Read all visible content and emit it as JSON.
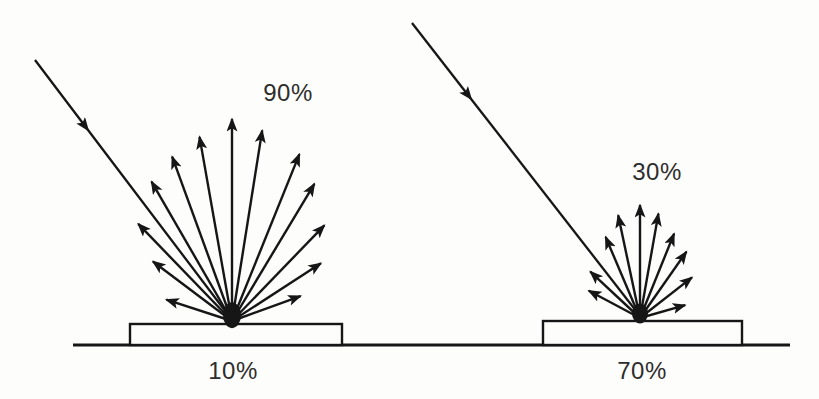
{
  "colors": {
    "background": "#fdfdfc",
    "ink": "#161616",
    "text": "#2d2d2d"
  },
  "ground": {
    "x1": 73,
    "x2": 790,
    "y": 345
  },
  "panels": [
    {
      "id": "high-reflection",
      "reflected_pct": "90%",
      "absorbed_pct": "10%",
      "incident_ray": {
        "x1": 35,
        "y1": 60,
        "x2": 232,
        "y2": 320,
        "head_t": 0.27
      },
      "fan_origin": {
        "x": 232,
        "y": 321
      },
      "scattered_rays": [
        {
          "angle": 162,
          "length": 69
        },
        {
          "angle": 143,
          "length": 99
        },
        {
          "angle": 134,
          "length": 135
        },
        {
          "angle": 120,
          "length": 161
        },
        {
          "angle": 110,
          "length": 175
        },
        {
          "angle": 100,
          "length": 187
        },
        {
          "angle": 90,
          "length": 202
        },
        {
          "angle": 81,
          "length": 193
        },
        {
          "angle": 68,
          "length": 180
        },
        {
          "angle": 59,
          "length": 160
        },
        {
          "angle": 46,
          "length": 133
        },
        {
          "angle": 33,
          "length": 106
        },
        {
          "angle": 20,
          "length": 73
        }
      ],
      "slab": {
        "x": 130,
        "y": 324,
        "width": 212,
        "height": 21
      },
      "blob": {
        "rx": 9,
        "ry": 13
      },
      "labels": {
        "reflected": {
          "x": 288,
          "y": 93
        },
        "absorbed": {
          "x": 233,
          "y": 371
        }
      }
    },
    {
      "id": "low-reflection",
      "reflected_pct": "30%",
      "absorbed_pct": "70%",
      "incident_ray": {
        "x1": 412,
        "y1": 23,
        "x2": 640,
        "y2": 316,
        "head_t": 0.26
      },
      "fan_origin": {
        "x": 640,
        "y": 318
      },
      "scattered_rays": [
        {
          "angle": 152,
          "length": 58
        },
        {
          "angle": 137,
          "length": 68
        },
        {
          "angle": 113,
          "length": 88
        },
        {
          "angle": 102,
          "length": 105
        },
        {
          "angle": 90,
          "length": 113
        },
        {
          "angle": 80,
          "length": 106
        },
        {
          "angle": 68,
          "length": 91
        },
        {
          "angle": 55,
          "length": 81
        },
        {
          "angle": 38,
          "length": 66
        },
        {
          "angle": 16,
          "length": 47
        }
      ],
      "slab": {
        "x": 543,
        "y": 321,
        "width": 199,
        "height": 24
      },
      "blob": {
        "rx": 8,
        "ry": 10
      },
      "labels": {
        "reflected": {
          "x": 657,
          "y": 172
        },
        "absorbed": {
          "x": 642,
          "y": 371
        }
      }
    }
  ]
}
